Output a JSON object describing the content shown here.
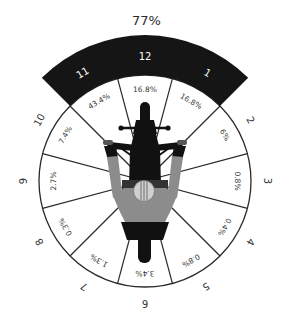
{
  "title": "77%",
  "highlight": {
    "label": "77%",
    "hours": [
      "11",
      "12",
      "1"
    ]
  },
  "segments": [
    {
      "hour": "12",
      "value": "16.8%",
      "highlighted": true
    },
    {
      "hour": "1",
      "value": "16.8%",
      "highlighted": true
    },
    {
      "hour": "2",
      "value": "6%",
      "highlighted": false
    },
    {
      "hour": "3",
      "value": "0.8%",
      "highlighted": false
    },
    {
      "hour": "4",
      "value": "0.4%",
      "highlighted": false
    },
    {
      "hour": "5",
      "value": "0.8%",
      "highlighted": false
    },
    {
      "hour": "6",
      "value": "3.4%",
      "highlighted": false
    },
    {
      "hour": "7",
      "value": "1.3%",
      "highlighted": false
    },
    {
      "hour": "8",
      "value": "0.3%",
      "highlighted": false
    },
    {
      "hour": "9",
      "value": "2.7%",
      "highlighted": false
    },
    {
      "hour": "10",
      "value": "7.4%",
      "highlighted": false
    },
    {
      "hour": "11",
      "value": "43.4%",
      "highlighted": true
    }
  ],
  "colors": {
    "band": "#151515",
    "band_text": "#ffffff",
    "outline": "#2a2a2a",
    "rider": "#8c8c8c",
    "motorcycle": "#111111",
    "helmet": "#d0d0d0"
  },
  "chart_data": {
    "type": "pie",
    "title": "77%",
    "categories": [
      "12",
      "1",
      "2",
      "3",
      "4",
      "5",
      "6",
      "7",
      "8",
      "9",
      "10",
      "11"
    ],
    "values": [
      16.8,
      16.8,
      6,
      0.8,
      0.4,
      0.8,
      3.4,
      1.3,
      0.3,
      2.7,
      7.4,
      43.4
    ],
    "unit": "%",
    "annotations": [
      "Highlighted band over clock positions 11, 12, 1 totals 77%"
    ],
    "layout": "12 equal clock-position sectors around a top-down motorcycle and rider"
  }
}
